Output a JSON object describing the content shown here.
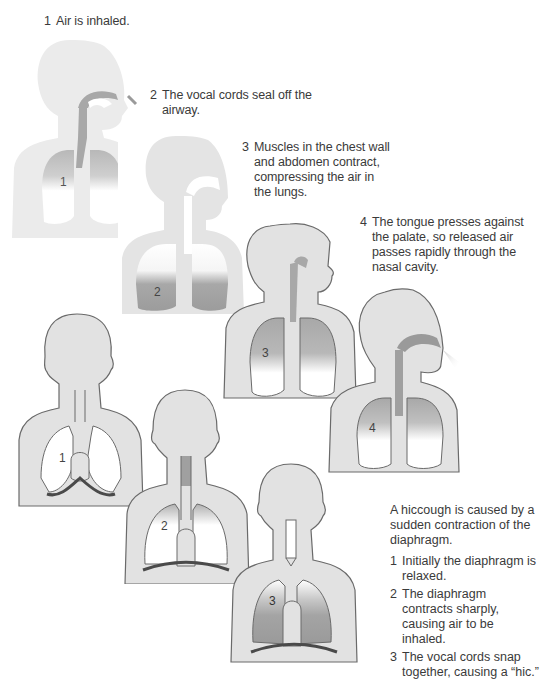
{
  "sneeze_steps": [
    {
      "num": "1",
      "text": "Air is inhaled."
    },
    {
      "num": "2",
      "text": "The vocal cords seal off the airway."
    },
    {
      "num": "3",
      "text": "Muscles in the chest wall and abdomen contract, compressing the air in the lungs."
    },
    {
      "num": "4",
      "text": "The tongue presses against the palate, so released air passes rapidly through the nasal cavity."
    }
  ],
  "sneeze_figure_labels": [
    "1",
    "2",
    "3",
    "4"
  ],
  "hiccough": {
    "intro": "A hiccough is caused by a sudden contraction of the diaphragm.",
    "steps": [
      {
        "num": "1",
        "text": "Initially the diaphragm is relaxed."
      },
      {
        "num": "2",
        "text": "The diaphragm contracts sharply, causing air to be inhaled."
      },
      {
        "num": "3",
        "text": "The vocal cords snap together, causing a “hic.”"
      }
    ],
    "figure_labels": [
      "1",
      "2",
      "3"
    ]
  },
  "colors": {
    "body_fill": "#e2e2e2",
    "body_fill_faded": "#ebebeb",
    "outline": "#6a6a6a",
    "airway_dark": "#9a9a9a",
    "diaphragm": "#4a4a4a",
    "text": "#3a3a3a"
  }
}
